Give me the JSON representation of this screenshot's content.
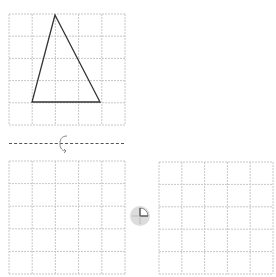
{
  "diagram": {
    "top_grid": {
      "rows": 5,
      "cols": 5,
      "triangle": {
        "vertices_grid_units": [
          [
            2,
            0
          ],
          [
            1,
            4
          ],
          [
            4,
            4
          ]
        ],
        "stroke_color": "#333333"
      }
    },
    "axis": {
      "style": "dashed",
      "icon": "rotation-arrow-icon"
    },
    "bottom_left_grid": {
      "rows": 5,
      "cols": 5,
      "content": "empty"
    },
    "middle_symbol": {
      "icon": "quarter-turn-icon",
      "meaning": "90-degree rotation"
    },
    "bottom_right_grid": {
      "rows": 5,
      "cols": 5,
      "content": "empty"
    },
    "colors": {
      "grid_line": "#c8c8c8",
      "shape_stroke": "#333333",
      "axis_line": "#555555",
      "symbol_fill": "#d9d9d9"
    }
  }
}
